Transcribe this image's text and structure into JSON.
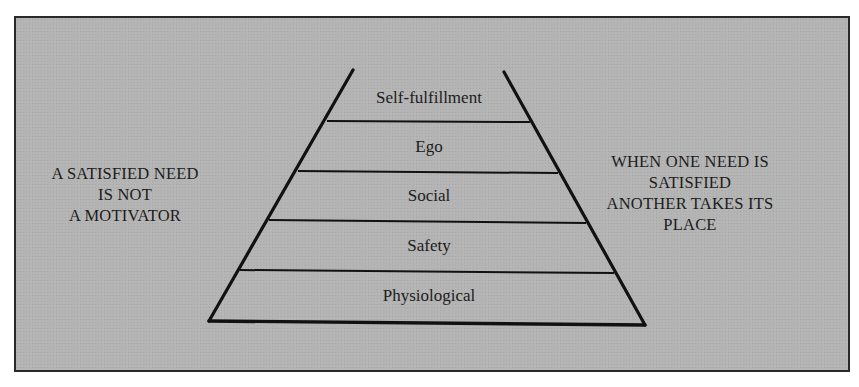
{
  "diagram": {
    "type": "pyramid",
    "title": "",
    "layers_top_to_bottom": [
      {
        "label": "Self-fulfillment"
      },
      {
        "label": "Ego"
      },
      {
        "label": "Social"
      },
      {
        "label": "Safety"
      },
      {
        "label": "Physiological"
      }
    ],
    "left_annotation": {
      "lines": [
        "A SATISFIED NEED",
        "IS NOT",
        "A MOTIVATOR"
      ]
    },
    "right_annotation": {
      "lines": [
        "WHEN ONE NEED IS",
        "SATISFIED",
        "ANOTHER TAKES ITS",
        "PLACE"
      ]
    },
    "colors": {
      "background": "#b4b4b4",
      "lines": "#111111",
      "text": "#1c1c1c",
      "frame_border": "#2a2a2a"
    }
  }
}
